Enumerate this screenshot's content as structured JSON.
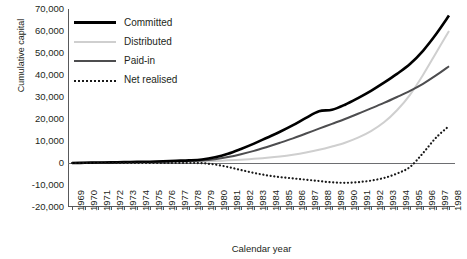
{
  "chart_data": {
    "type": "line",
    "title": "",
    "xlabel": "Calendar year",
    "ylabel": "Cumulative capital",
    "xlim": [
      1969,
      1998
    ],
    "ylim": [
      -20000,
      70000
    ],
    "ytick_step": 10000,
    "grid": false,
    "legend_position": "top-left",
    "x": [
      1969,
      1970,
      1971,
      1972,
      1973,
      1974,
      1975,
      1976,
      1977,
      1978,
      1979,
      1980,
      1981,
      1982,
      1983,
      1984,
      1985,
      1986,
      1987,
      1988,
      1989,
      1990,
      1991,
      1992,
      1993,
      1994,
      1995,
      1996,
      1997,
      1998
    ],
    "categories": [
      "1969",
      "1970",
      "1971",
      "1972",
      "1973",
      "1974",
      "1975",
      "1976",
      "1977",
      "1978",
      "1979",
      "1980",
      "1981",
      "1982",
      "1983",
      "1984",
      "1985",
      "1986",
      "1987",
      "1988",
      "1989",
      "1990",
      "1991",
      "1992",
      "1993",
      "1994",
      "1995",
      "1996",
      "1997",
      "1998"
    ],
    "yticks": [
      70000,
      60000,
      50000,
      40000,
      30000,
      20000,
      10000,
      0,
      -10000,
      -20000
    ],
    "ytick_labels": [
      "70,000",
      "60,000",
      "50,000",
      "40,000",
      "30,000",
      "20,000",
      "10,000",
      "0",
      "-10,000",
      "-20,000"
    ],
    "series": [
      {
        "name": "Committed",
        "color": "#000000",
        "style": "solid",
        "width": 2.6,
        "values": [
          0,
          100,
          200,
          300,
          400,
          500,
          600,
          800,
          1000,
          1200,
          1600,
          2600,
          4200,
          6400,
          8800,
          11500,
          14200,
          17200,
          20500,
          23500,
          24200,
          26500,
          29500,
          32800,
          36500,
          40500,
          45000,
          51000,
          58500,
          67000
        ]
      },
      {
        "name": "Distributed",
        "color": "#cfcfcf",
        "style": "solid",
        "width": 2,
        "values": [
          0,
          50,
          100,
          150,
          200,
          250,
          300,
          400,
          500,
          600,
          700,
          900,
          1200,
          1500,
          1900,
          2400,
          3000,
          3800,
          4800,
          6000,
          7500,
          9200,
          11500,
          14500,
          18500,
          24000,
          31000,
          40000,
          50000,
          60000
        ]
      },
      {
        "name": "Paid-in",
        "color": "#4d4d4f",
        "style": "solid",
        "width": 2,
        "values": [
          0,
          80,
          160,
          240,
          320,
          400,
          480,
          600,
          750,
          900,
          1100,
          1700,
          2700,
          4000,
          5500,
          7300,
          9200,
          11200,
          13400,
          15600,
          17800,
          20000,
          22400,
          24800,
          27300,
          30000,
          32800,
          36000,
          39800,
          44000
        ]
      },
      {
        "name": "Net realised",
        "color": "#1a1a1a",
        "style": "dotted",
        "width": 2.2,
        "values": [
          0,
          0,
          0,
          0,
          0,
          0,
          0,
          0,
          0,
          0,
          -100,
          -700,
          -1800,
          -3200,
          -4500,
          -5600,
          -6400,
          -7000,
          -7600,
          -8200,
          -8800,
          -9000,
          -8700,
          -8000,
          -6800,
          -4800,
          -1800,
          4500,
          11500,
          16800
        ]
      }
    ]
  },
  "legend": {
    "items": [
      {
        "label": "Committed",
        "swatch": "committed"
      },
      {
        "label": "Distributed",
        "swatch": "distributed"
      },
      {
        "label": "Paid-in",
        "swatch": "paidin"
      },
      {
        "label": "Net realised",
        "swatch": "netrealised"
      }
    ]
  },
  "axes": {
    "y_title": "Cumulative capital",
    "x_title": "Calendar year"
  }
}
